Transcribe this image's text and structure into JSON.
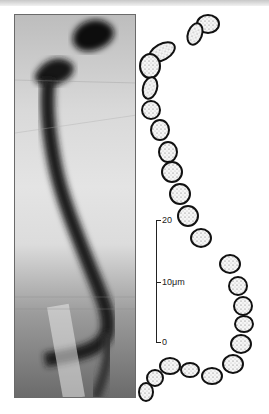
{
  "figure": {
    "type": "micrograph-with-tracing",
    "panels": [
      {
        "name": "photograph",
        "description": "Grayscale photomicrograph of a banded chromosome-like filament"
      },
      {
        "name": "line-drawing",
        "description": "Stippled line tracing of the same segmented filament"
      }
    ]
  },
  "scale_bar": {
    "top_label": "20",
    "middle_label": "10μm",
    "bottom_label": "0"
  }
}
